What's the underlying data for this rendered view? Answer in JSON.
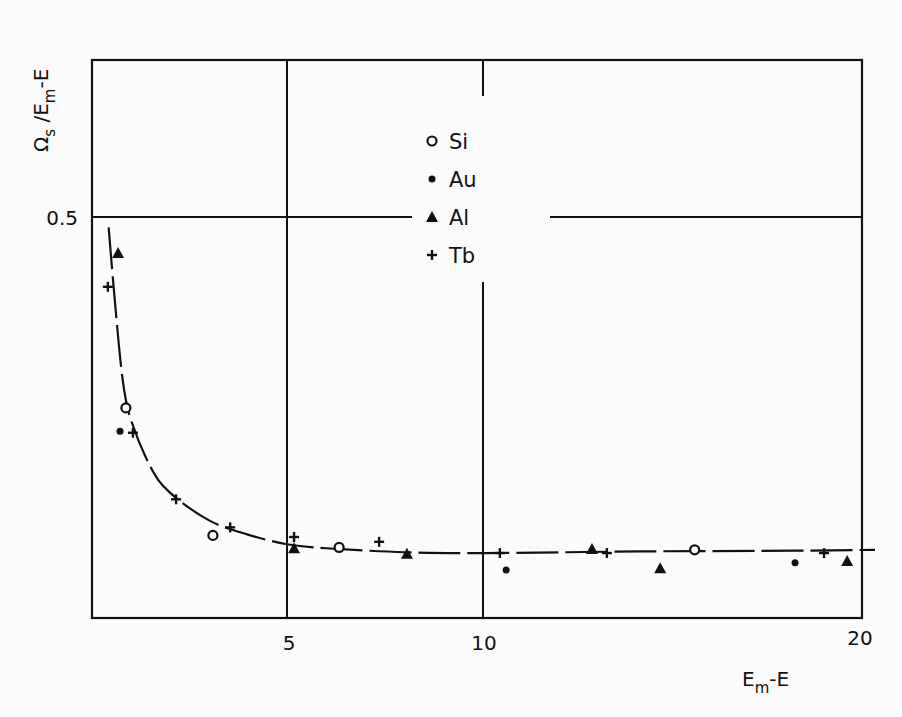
{
  "chart_data": {
    "type": "scatter",
    "title": "",
    "xlabel": "E_m-E",
    "ylabel": "Ω_s / E_m-E",
    "xlim": [
      0,
      20
    ],
    "ylim": [
      0,
      0.7
    ],
    "grid": true,
    "x_gridlines": [
      5,
      10
    ],
    "y_gridlines": [
      0.5
    ],
    "x_ticks": [
      5,
      10,
      20
    ],
    "x_tick_labels": [
      "5",
      "10",
      "20"
    ],
    "y_ticks": [
      0.5
    ],
    "y_tick_labels": [
      "0.5"
    ],
    "legend_position": "upper center (inside plot)",
    "legend": [
      {
        "label": "Si",
        "marker": "open-circle"
      },
      {
        "label": "Au",
        "marker": "filled-dot"
      },
      {
        "label": "Al",
        "marker": "filled-triangle"
      },
      {
        "label": "Tb",
        "marker": "plus"
      }
    ],
    "series": [
      {
        "name": "Si",
        "marker": "open-circle",
        "points": [
          [
            0.89,
            0.262
          ],
          [
            3.11,
            0.103
          ],
          [
            6.33,
            0.088
          ],
          [
            15.4,
            0.085
          ]
        ]
      },
      {
        "name": "Au",
        "marker": "filled-dot",
        "points": [
          [
            0.74,
            0.233
          ],
          [
            10.59,
            0.06
          ],
          [
            17.96,
            0.069
          ]
        ]
      },
      {
        "name": "Al",
        "marker": "filled-triangle",
        "points": [
          [
            0.69,
            0.455
          ],
          [
            5.18,
            0.087
          ],
          [
            8.06,
            0.08
          ],
          [
            12.78,
            0.086
          ],
          [
            14.52,
            0.062
          ],
          [
            19.29,
            0.071
          ]
        ]
      },
      {
        "name": "Tb",
        "marker": "plus",
        "points": [
          [
            0.43,
            0.413
          ],
          [
            1.07,
            0.231
          ],
          [
            2.17,
            0.148
          ],
          [
            3.55,
            0.113
          ],
          [
            5.18,
            0.101
          ],
          [
            7.35,
            0.095
          ],
          [
            10.43,
            0.081
          ],
          [
            13.16,
            0.081
          ],
          [
            18.7,
            0.081
          ]
        ]
      }
    ],
    "fit_curve": {
      "description": "smooth hand-drawn fit curve, decaying from ~0.49 near x≈0.45 to a plateau ≈0.08",
      "points": [
        [
          0.45,
          0.487
        ],
        [
          0.6,
          0.4
        ],
        [
          0.8,
          0.3
        ],
        [
          1.0,
          0.25
        ],
        [
          1.5,
          0.19
        ],
        [
          2.0,
          0.157
        ],
        [
          3.0,
          0.122
        ],
        [
          4.0,
          0.104
        ],
        [
          5.0,
          0.092
        ],
        [
          6.0,
          0.087
        ],
        [
          8.0,
          0.082
        ],
        [
          10.0,
          0.081
        ],
        [
          14.0,
          0.083
        ],
        [
          18.0,
          0.084
        ],
        [
          20.0,
          0.085
        ]
      ]
    }
  }
}
